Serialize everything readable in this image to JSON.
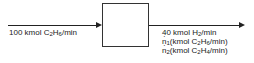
{
  "diagram": {
    "process_unit": {
      "label": ""
    },
    "inlet": {
      "parts": [
        "100 kmol C",
        "2",
        "H",
        "6",
        "/min"
      ]
    },
    "outlet": {
      "line1": [
        "40 kmol  H",
        "2",
        "/min"
      ],
      "line2": [
        "n",
        "1",
        "(kmol C",
        "2",
        "H",
        "6",
        "/min)"
      ],
      "line3": [
        "n",
        "2",
        "(kmol C",
        "2",
        "H",
        "4",
        "/min)"
      ]
    }
  }
}
